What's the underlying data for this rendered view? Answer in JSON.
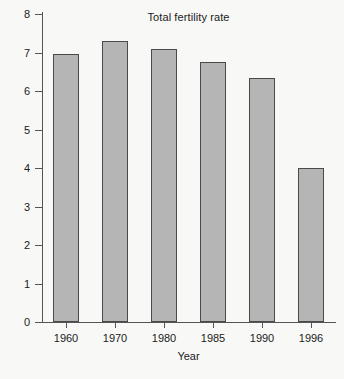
{
  "chart_data": {
    "type": "bar",
    "title": "Total fertility rate",
    "xlabel": "Year",
    "ylabel": "",
    "categories": [
      "1960",
      "1970",
      "1980",
      "1985",
      "1990",
      "1996"
    ],
    "values": [
      6.95,
      7.3,
      7.1,
      6.75,
      6.35,
      4.0
    ],
    "ylim": [
      0,
      8
    ],
    "ytick_labels": [
      "0",
      "1",
      "2",
      "3",
      "4",
      "5",
      "6",
      "7",
      "8"
    ],
    "ytick_values": [
      0,
      1,
      2,
      3,
      4,
      5,
      6,
      7,
      8
    ],
    "grid": false,
    "legend": false,
    "colors": {
      "bar_fill": "#b5b5b5",
      "bar_border": "#4a4a4a",
      "axis": "#555555",
      "text": "#1a1a1a",
      "background": "#f8f8f6"
    }
  }
}
